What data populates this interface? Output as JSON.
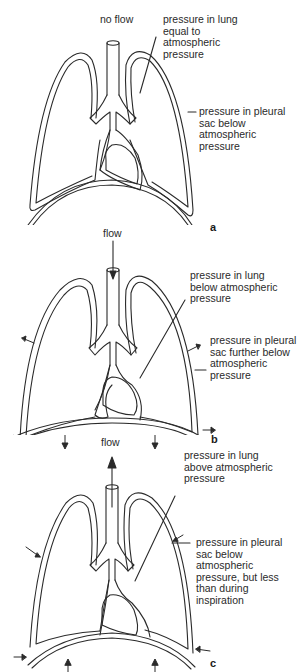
{
  "figure": {
    "panels": [
      {
        "id": "a",
        "label": "a",
        "flow_label": "no flow",
        "lung_label": [
          "pressure in lung",
          "equal to",
          "atmospheric",
          "pressure"
        ],
        "pleural_label": [
          "pressure in pleural",
          "sac below",
          "atmospheric",
          "pressure"
        ]
      },
      {
        "id": "b",
        "label": "b",
        "flow_label": "flow",
        "lung_label": [
          "pressure in lung",
          "below atmospheric",
          "pressure"
        ],
        "pleural_label": [
          "pressure in pleural",
          "sac further below",
          "atmospheric",
          "pressure"
        ]
      },
      {
        "id": "c",
        "label": "c",
        "flow_label": "flow",
        "lung_label": [
          "pressure in lung",
          "above atmospheric",
          "pressure"
        ],
        "pleural_label": [
          "pressure in pleural",
          "sac below",
          "atmospheric",
          "pressure, but less",
          "than during",
          "inspiration"
        ]
      }
    ],
    "stroke_color": "#2a2a2a",
    "background_color": "#ffffff"
  }
}
